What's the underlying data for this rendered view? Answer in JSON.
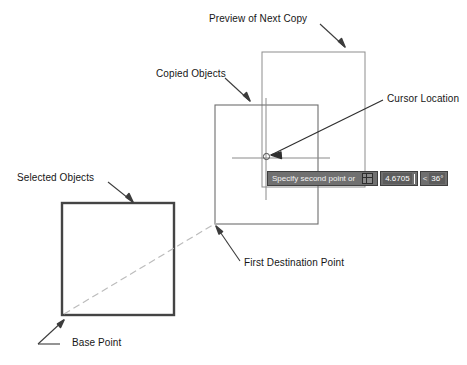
{
  "diagram": {
    "title_context": "AutoCAD COPY command with dynamic input",
    "annotations": [
      {
        "id": "preview-of-next-copy",
        "label": "Preview of Next Copy"
      },
      {
        "id": "copied-objects",
        "label": "Copied Objects"
      },
      {
        "id": "cursor-location",
        "label": "Cursor Location"
      },
      {
        "id": "selected-objects",
        "label": "Selected Objects"
      },
      {
        "id": "first-destination-point",
        "label": "First Destination Point"
      },
      {
        "id": "base-point",
        "label": "Base Point"
      }
    ],
    "colors": {
      "stroke_dark": "#3c3c3c",
      "stroke_mid": "#6e6e6e",
      "stroke_light": "#9a9a9a",
      "dashed_guide": "#b9b9b9",
      "text": "#161616",
      "bar_background": "#707070",
      "field_background": "#5d5d5d"
    }
  },
  "command_bar": {
    "prompt": "Specify second point or",
    "options_icon": "grid-icon",
    "distance_value": "4.6705",
    "angle_value": "36°",
    "angle_prefix": "<"
  }
}
